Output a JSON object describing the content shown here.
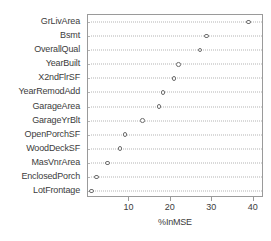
{
  "chart_data": {
    "type": "scatter",
    "title": "",
    "subtitle": "",
    "xlabel": "%InMSE",
    "ylabel": "",
    "xlim": [
      0,
      42.5
    ],
    "ylim": [
      0,
      14
    ],
    "grid": true,
    "grid_style": "dotted-horizontal",
    "legend": false,
    "marker": "open-circle",
    "orientation": "horizontal-dotplot",
    "xticks": [
      10,
      20,
      30,
      40
    ],
    "xtick_labels": [
      "10",
      "20",
      "30",
      "40"
    ],
    "categories": [
      "GrLivArea",
      "Bsmt",
      "OverallQual",
      "YearBuilt",
      "X2ndFlrSF",
      "YearRemodAdd",
      "GarageArea",
      "GarageYrBlt",
      "OpenPorchSF",
      "WoodDeckSF",
      "MasVnrArea",
      "EnclosedPorch",
      "LotFrontage"
    ],
    "values": [
      38.7,
      28.6,
      27.0,
      21.9,
      20.8,
      18.1,
      17.2,
      13.2,
      8.9,
      7.7,
      4.7,
      2.1,
      0.8
    ],
    "points": [
      {
        "label": "GrLivArea",
        "value": 38.7
      },
      {
        "label": "Bsmt",
        "value": 28.6
      },
      {
        "label": "OverallQual",
        "value": 27.0
      },
      {
        "label": "YearBuilt",
        "value": 21.9
      },
      {
        "label": "X2ndFlrSF",
        "value": 20.8
      },
      {
        "label": "YearRemodAdd",
        "value": 18.1
      },
      {
        "label": "GarageArea",
        "value": 17.2
      },
      {
        "label": "GarageYrBlt",
        "value": 13.2
      },
      {
        "label": "OpenPorchSF",
        "value": 8.9
      },
      {
        "label": "WoodDeckSF",
        "value": 7.7
      },
      {
        "label": "MasVnrArea",
        "value": 4.7
      },
      {
        "label": "EnclosedPorch",
        "value": 2.1
      },
      {
        "label": "LotFrontage",
        "value": 0.8
      }
    ],
    "colors": {
      "marker_stroke": "#6e6e6e",
      "marker_fill": "#ffffff",
      "grid": "#b4b4b4",
      "frame": "#9a9a9a",
      "text": "#3c3c3c",
      "background": "#ffffff"
    }
  }
}
